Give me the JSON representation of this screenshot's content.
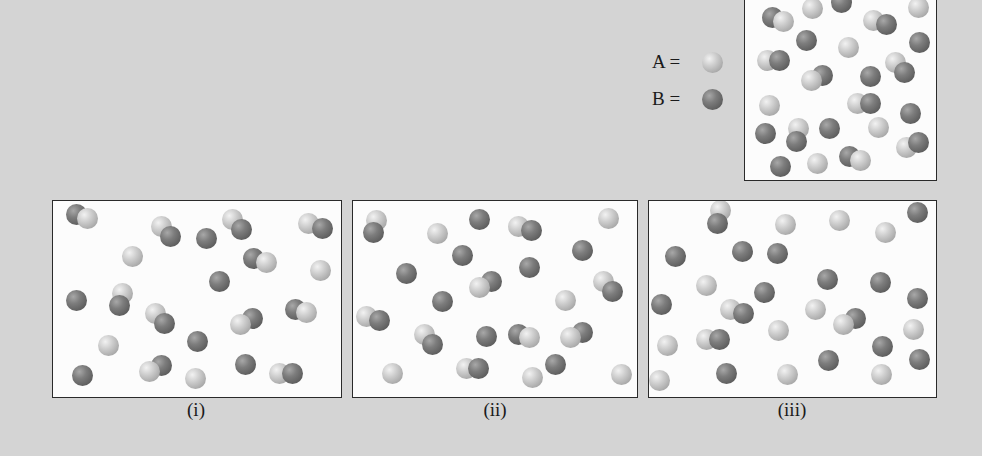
{
  "legend": {
    "a_label": "A =",
    "b_label": "B =",
    "a_color": "#c4c4c4",
    "b_color": "#6e6e6e"
  },
  "reference_box": {
    "rect": [
      744,
      -4,
      193,
      185
    ],
    "particles": [
      [
        "B",
        773,
        18
      ],
      [
        "A",
        784,
        22
      ],
      [
        "A",
        813,
        9
      ],
      [
        "B",
        842,
        3
      ],
      [
        "A",
        874,
        21
      ],
      [
        "B",
        887,
        25
      ],
      [
        "A",
        919,
        8
      ],
      [
        "B",
        807,
        41
      ],
      [
        "A",
        849,
        48
      ],
      [
        "B",
        920,
        43
      ],
      [
        "A",
        768,
        61
      ],
      [
        "B",
        780,
        61
      ],
      [
        "B",
        823,
        76
      ],
      [
        "A",
        812,
        81
      ],
      [
        "B",
        871,
        77
      ],
      [
        "A",
        896,
        63
      ],
      [
        "B",
        905,
        73
      ],
      [
        "A",
        770,
        106
      ],
      [
        "A",
        858,
        104
      ],
      [
        "B",
        871,
        104
      ],
      [
        "B",
        911,
        114
      ],
      [
        "B",
        766,
        134
      ],
      [
        "A",
        799,
        129
      ],
      [
        "B",
        797,
        142
      ],
      [
        "B",
        830,
        129
      ],
      [
        "A",
        879,
        128
      ],
      [
        "A",
        907,
        148
      ],
      [
        "B",
        919,
        143
      ],
      [
        "B",
        781,
        167
      ],
      [
        "A",
        818,
        164
      ],
      [
        "B",
        850,
        157
      ],
      [
        "A",
        861,
        161
      ]
    ]
  },
  "panels": [
    {
      "label": "(i)",
      "label_pos": [
        196,
        411
      ],
      "rect": [
        52,
        200,
        290,
        198
      ],
      "particles": [
        [
          "B",
          77,
          215
        ],
        [
          "A",
          88,
          219
        ],
        [
          "A",
          162,
          227
        ],
        [
          "B",
          171,
          237
        ],
        [
          "B",
          207,
          239
        ],
        [
          "A",
          233,
          220
        ],
        [
          "B",
          242,
          230
        ],
        [
          "A",
          309,
          224
        ],
        [
          "B",
          323,
          229
        ],
        [
          "A",
          133,
          257
        ],
        [
          "B",
          254,
          259
        ],
        [
          "A",
          267,
          263
        ],
        [
          "A",
          321,
          271
        ],
        [
          "B",
          220,
          282
        ],
        [
          "B",
          77,
          301
        ],
        [
          "A",
          123,
          294
        ],
        [
          "B",
          120,
          306
        ],
        [
          "A",
          156,
          314
        ],
        [
          "B",
          165,
          324
        ],
        [
          "B",
          253,
          319
        ],
        [
          "A",
          241,
          325
        ],
        [
          "B",
          296,
          310
        ],
        [
          "A",
          307,
          313
        ],
        [
          "A",
          109,
          346
        ],
        [
          "B",
          198,
          342
        ],
        [
          "B",
          83,
          376
        ],
        [
          "B",
          162,
          366
        ],
        [
          "A",
          150,
          372
        ],
        [
          "A",
          196,
          379
        ],
        [
          "B",
          246,
          365
        ],
        [
          "A",
          280,
          374
        ],
        [
          "B",
          293,
          374
        ]
      ]
    },
    {
      "label": "(ii)",
      "label_pos": [
        495,
        411
      ],
      "rect": [
        352,
        200,
        286,
        198
      ],
      "particles": [
        [
          "A",
          377,
          221
        ],
        [
          "B",
          374,
          233
        ],
        [
          "A",
          438,
          234
        ],
        [
          "B",
          480,
          220
        ],
        [
          "A",
          519,
          227
        ],
        [
          "B",
          532,
          231
        ],
        [
          "A",
          609,
          219
        ],
        [
          "B",
          463,
          256
        ],
        [
          "B",
          583,
          251
        ],
        [
          "B",
          407,
          274
        ],
        [
          "B",
          530,
          268
        ],
        [
          "B",
          492,
          282
        ],
        [
          "A",
          480,
          288
        ],
        [
          "A",
          604,
          282
        ],
        [
          "B",
          613,
          292
        ],
        [
          "B",
          443,
          302
        ],
        [
          "A",
          566,
          301
        ],
        [
          "A",
          367,
          317
        ],
        [
          "B",
          380,
          321
        ],
        [
          "A",
          425,
          335
        ],
        [
          "B",
          433,
          345
        ],
        [
          "B",
          487,
          337
        ],
        [
          "B",
          519,
          335
        ],
        [
          "A",
          530,
          338
        ],
        [
          "B",
          583,
          333
        ],
        [
          "A",
          571,
          338
        ],
        [
          "A",
          393,
          374
        ],
        [
          "A",
          467,
          369
        ],
        [
          "B",
          479,
          369
        ],
        [
          "B",
          556,
          365
        ],
        [
          "A",
          533,
          378
        ],
        [
          "A",
          622,
          375
        ]
      ]
    },
    {
      "label": "(iii)",
      "label_pos": [
        792,
        411
      ],
      "rect": [
        648,
        200,
        289,
        198
      ],
      "particles": [
        [
          "A",
          721,
          211
        ],
        [
          "B",
          718,
          224
        ],
        [
          "A",
          786,
          225
        ],
        [
          "A",
          840,
          221
        ],
        [
          "A",
          886,
          233
        ],
        [
          "B",
          918,
          213
        ],
        [
          "B",
          676,
          257
        ],
        [
          "B",
          743,
          252
        ],
        [
          "B",
          778,
          254
        ],
        [
          "A",
          707,
          286
        ],
        [
          "B",
          828,
          280
        ],
        [
          "B",
          881,
          283
        ],
        [
          "B",
          765,
          293
        ],
        [
          "B",
          662,
          305
        ],
        [
          "B",
          918,
          299
        ],
        [
          "A",
          731,
          310
        ],
        [
          "B",
          744,
          314
        ],
        [
          "A",
          816,
          310
        ],
        [
          "B",
          856,
          319
        ],
        [
          "A",
          844,
          325
        ],
        [
          "A",
          779,
          331
        ],
        [
          "A",
          914,
          330
        ],
        [
          "A",
          707,
          340
        ],
        [
          "B",
          720,
          340
        ],
        [
          "A",
          668,
          346
        ],
        [
          "B",
          883,
          347
        ],
        [
          "B",
          920,
          360
        ],
        [
          "B",
          829,
          361
        ],
        [
          "B",
          727,
          374
        ],
        [
          "A",
          788,
          375
        ],
        [
          "A",
          882,
          375
        ],
        [
          "A",
          660,
          381
        ]
      ]
    }
  ]
}
